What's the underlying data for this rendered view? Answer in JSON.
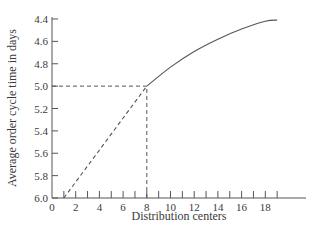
{
  "chart_data": {
    "type": "line",
    "title": "",
    "xlabel": "Distribution centers",
    "ylabel": "Average order cycle time in days",
    "xlim": [
      0,
      20
    ],
    "ylim": [
      6.0,
      4.4
    ],
    "y_inverted": true,
    "grid": false,
    "legend": null,
    "x_ticks": [
      0,
      2,
      4,
      6,
      8,
      10,
      12,
      14,
      16,
      18
    ],
    "x_minor_ticks": [
      1,
      3,
      5,
      7,
      9,
      11,
      13,
      15,
      17,
      19
    ],
    "y_ticks": [
      "4.4",
      "4.6",
      "4.8",
      "5.0",
      "5.2",
      "5.4",
      "5.6",
      "5.8",
      "6.0"
    ],
    "series": [
      {
        "name": "extrapolated",
        "style": "dashed",
        "x": [
          1,
          8
        ],
        "y": [
          6.0,
          5.0
        ]
      },
      {
        "name": "order cycle time",
        "style": "solid",
        "x": [
          8,
          10,
          12,
          14,
          16,
          18,
          19
        ],
        "y": [
          5.0,
          4.83,
          4.69,
          4.58,
          4.49,
          4.42,
          4.41
        ]
      }
    ],
    "annotations": [
      {
        "type": "reference-line",
        "style": "dashed",
        "from": [
          0,
          5.0
        ],
        "to": [
          8,
          5.0
        ]
      },
      {
        "type": "reference-line",
        "style": "dashed",
        "from": [
          8,
          6.0
        ],
        "to": [
          8,
          5.0
        ]
      }
    ]
  },
  "colors": {
    "axis": "#555555",
    "line": "#555555",
    "text": "#3a3a3a",
    "background": "#ffffff"
  }
}
